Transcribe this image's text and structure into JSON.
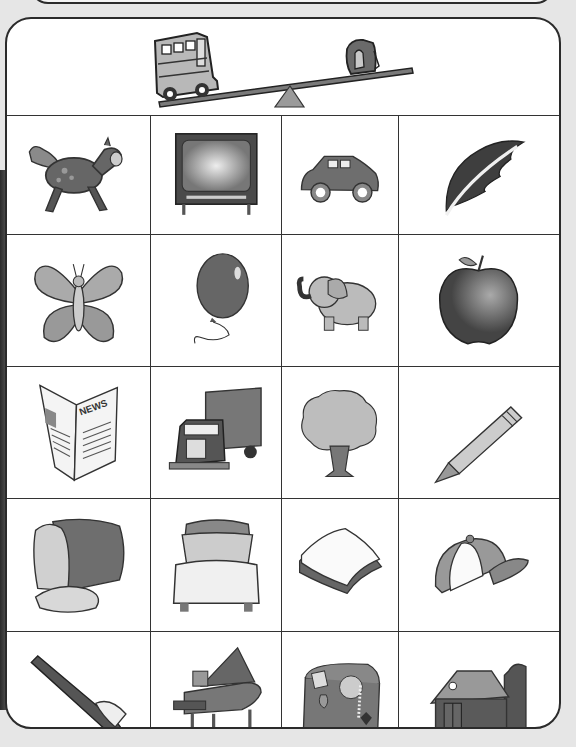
{
  "worksheet": {
    "header": {
      "illustration": "seesaw",
      "heavy_side_item": "school bus",
      "light_side_item": "backpack",
      "description": "A seesaw with a heavy school bus on the low left side and a light backpack on the high right side"
    },
    "grid": {
      "rows": 5,
      "columns": 4,
      "items": [
        {
          "row": 1,
          "col": 1,
          "name": "horse"
        },
        {
          "row": 1,
          "col": 2,
          "name": "television"
        },
        {
          "row": 1,
          "col": 3,
          "name": "car"
        },
        {
          "row": 1,
          "col": 4,
          "name": "feather"
        },
        {
          "row": 2,
          "col": 1,
          "name": "butterfly"
        },
        {
          "row": 2,
          "col": 2,
          "name": "balloon"
        },
        {
          "row": 2,
          "col": 3,
          "name": "elephant"
        },
        {
          "row": 2,
          "col": 4,
          "name": "apple"
        },
        {
          "row": 3,
          "col": 1,
          "name": "newspaper"
        },
        {
          "row": 3,
          "col": 2,
          "name": "truck"
        },
        {
          "row": 3,
          "col": 3,
          "name": "tree"
        },
        {
          "row": 3,
          "col": 4,
          "name": "pencil"
        },
        {
          "row": 4,
          "col": 1,
          "name": "bread loaf"
        },
        {
          "row": 4,
          "col": 2,
          "name": "bed"
        },
        {
          "row": 4,
          "col": 3,
          "name": "sandwich"
        },
        {
          "row": 4,
          "col": 4,
          "name": "baseball cap"
        },
        {
          "row": 5,
          "col": 1,
          "name": "toothbrush"
        },
        {
          "row": 5,
          "col": 2,
          "name": "grand piano"
        },
        {
          "row": 5,
          "col": 3,
          "name": "treasure chest"
        },
        {
          "row": 5,
          "col": 4,
          "name": "barn"
        }
      ],
      "newspaper_text": "NEWS"
    },
    "colors": {
      "border": "#2b2b2b",
      "paper": "#ffffff",
      "background": "#e6e6e6",
      "dark_fill": "#5a5a5a",
      "mid_fill": "#8c8c8c",
      "light_fill": "#c8c8c8"
    }
  }
}
